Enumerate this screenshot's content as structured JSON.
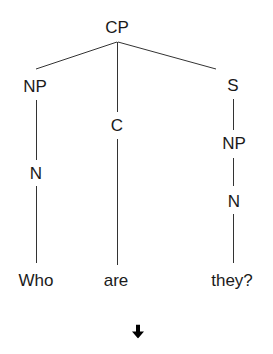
{
  "diagram": {
    "type": "syntax-tree",
    "line_color": "#333333",
    "text_color": "#1a1a1a",
    "nodes": {
      "root": "CP",
      "left_np": "NP",
      "complementizer": "C",
      "sentence": "S",
      "right_np": "NP",
      "left_n": "N",
      "right_n": "N"
    },
    "words": [
      "Who",
      "are",
      "they?"
    ],
    "arrow_icon": "down-arrow-icon",
    "arrow_glyph": "🡇"
  }
}
